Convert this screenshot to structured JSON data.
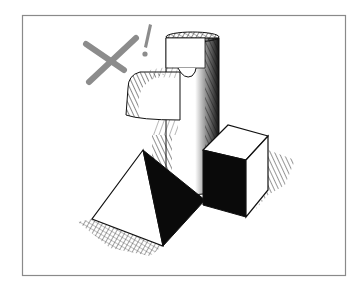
{
  "illustration": {
    "subject": "pen-and-ink drawing of geometric solids: a cylinder with a face-like protrusion, a pyramid, and a cube, with a gray X and exclamation mark",
    "frame": {
      "x": 22,
      "y": 15,
      "width": 324,
      "height": 261,
      "stroke": "#8a8a8a"
    },
    "colors": {
      "ink": "#111111",
      "paper": "#ffffff",
      "mark": "#8c8c8c",
      "frame": "#8a8a8a"
    },
    "annotation": {
      "cross_symbol": "✕",
      "exclamation": "!"
    }
  }
}
